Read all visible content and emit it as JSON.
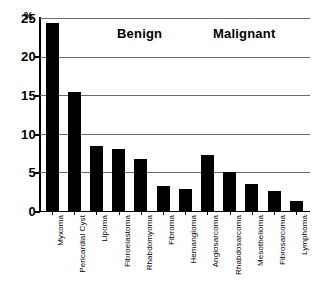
{
  "chart_data": {
    "type": "bar",
    "title": "",
    "xlabel": "",
    "ylabel": "%",
    "unit_symbol": "%",
    "ylim": [
      0,
      25
    ],
    "yticks": [
      0,
      5,
      10,
      15,
      20,
      25
    ],
    "ytick_labels": [
      "0",
      "5",
      "10",
      "15",
      "20",
      "25"
    ],
    "grid": true,
    "legend": "none",
    "bar_color": "#000000",
    "categories": [
      "Myxoma",
      "Pericardial Cyst",
      "Lipoma",
      "Fibroelastoma",
      "Rhabdomyoma",
      "Fibroma",
      "Hemangioma",
      "Angiosarcoma",
      "Rhabdosarcoma",
      "Mesothelioma",
      "Fibrosarcoma",
      "Lymphoma"
    ],
    "values": [
      24.3,
      15.4,
      8.4,
      8.0,
      6.8,
      3.2,
      2.9,
      7.2,
      5.0,
      3.5,
      2.6,
      1.3
    ],
    "annotations": [
      {
        "text": "Benign",
        "x_fraction": 0.33
      },
      {
        "text": "Malignant",
        "x_fraction": 0.72
      }
    ]
  }
}
